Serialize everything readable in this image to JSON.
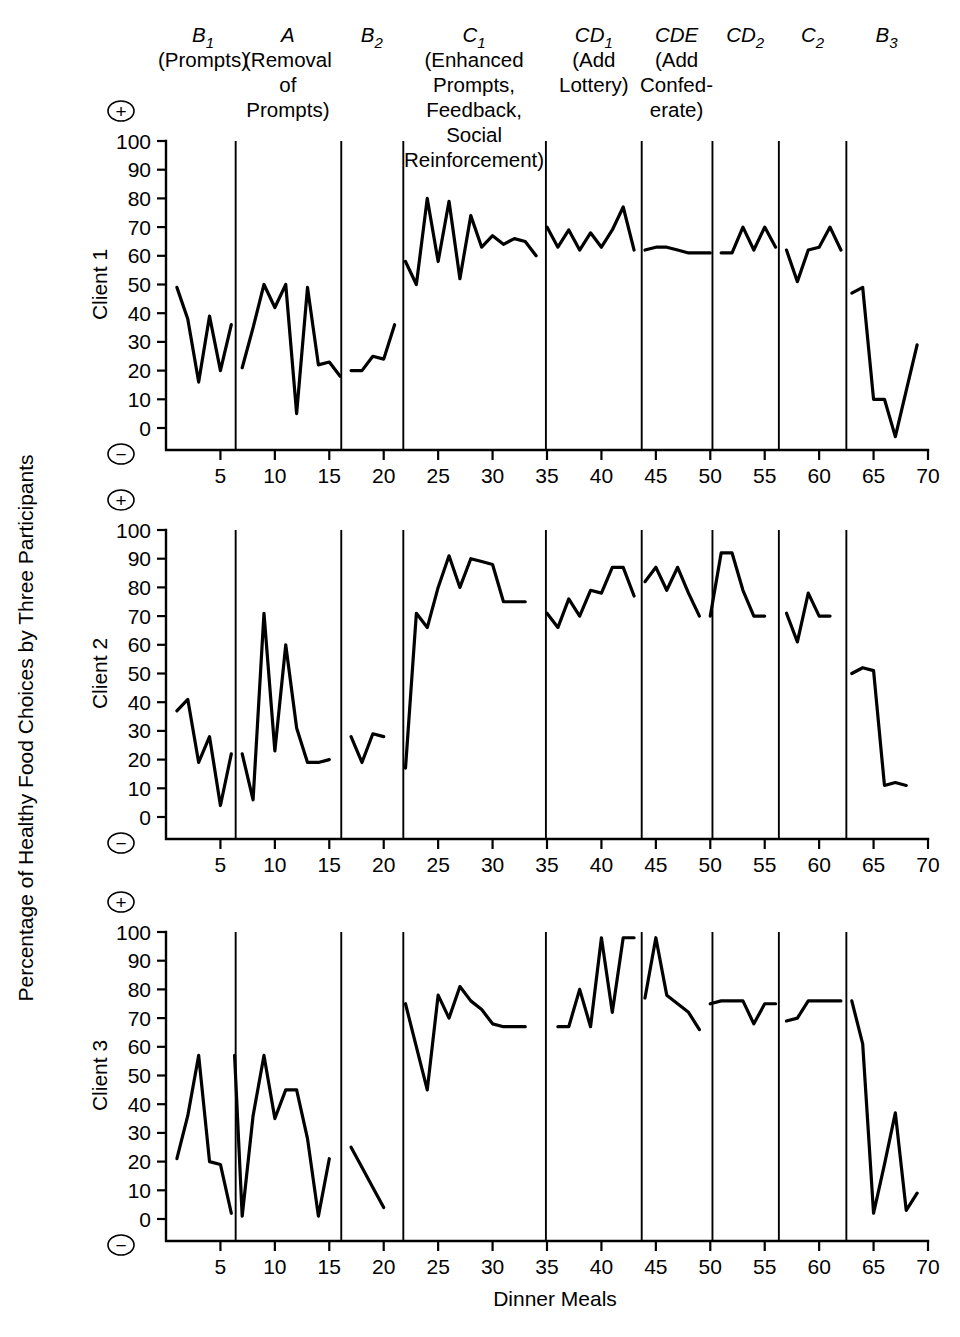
{
  "figure": {
    "ylabel": "Percentage of Healthy Food Choices by Three Participants",
    "xlabel": "Dinner Meals",
    "plus_sign": "+",
    "minus_sign": "−",
    "line_color": "#000000",
    "background": "#ffffff"
  },
  "axes": {
    "y_ticks": [
      100,
      90,
      80,
      70,
      60,
      50,
      40,
      30,
      20,
      10,
      0
    ],
    "y_tick_labels": [
      "100",
      "90",
      "80",
      "70",
      "60",
      "50",
      "40",
      "30",
      "20",
      "10",
      "0"
    ],
    "x_ticks": [
      5,
      10,
      15,
      20,
      25,
      30,
      35,
      40,
      45,
      50,
      55,
      60,
      65,
      70
    ],
    "x_tick_labels": [
      "5",
      "10",
      "15",
      "20",
      "25",
      "30",
      "35",
      "40",
      "45",
      "50",
      "55",
      "60",
      "65",
      "70"
    ],
    "xlim": [
      0,
      70
    ],
    "ylim": [
      0,
      100
    ],
    "grid": false
  },
  "phases": [
    {
      "id": "B1",
      "code": "B",
      "sub": "1",
      "desc_lines": [
        "(Prompts)"
      ],
      "start": 0.6,
      "end": 6.4,
      "center": 3.4
    },
    {
      "id": "A",
      "code": "A",
      "sub": "",
      "desc_lines": [
        "(Removal",
        "of",
        "Prompts)"
      ],
      "start": 6.4,
      "end": 16.1,
      "center": 11.2
    },
    {
      "id": "B2",
      "code": "B",
      "sub": "2",
      "desc_lines": [],
      "start": 16.1,
      "end": 21.8,
      "center": 18.9
    },
    {
      "id": "C1",
      "code": "C",
      "sub": "1",
      "desc_lines": [
        "(Enhanced",
        "Prompts,",
        "Feedback,",
        "Social",
        "Reinforcement)"
      ],
      "start": 21.8,
      "end": 34.9,
      "center": 28.3
    },
    {
      "id": "CD1",
      "code": "CD",
      "sub": "1",
      "desc_lines": [
        "(Add",
        "Lottery)"
      ],
      "start": 34.9,
      "end": 43.7,
      "center": 39.3
    },
    {
      "id": "CDE",
      "code": "CDE",
      "sub": "",
      "desc_lines": [
        "(Add",
        "Confed-",
        "erate)"
      ],
      "start": 43.7,
      "end": 50.2,
      "center": 46.9
    },
    {
      "id": "CD2",
      "code": "CD",
      "sub": "2",
      "desc_lines": [],
      "start": 50.2,
      "end": 56.3,
      "center": 53.2
    },
    {
      "id": "C2",
      "code": "C",
      "sub": "2",
      "desc_lines": [],
      "start": 56.3,
      "end": 62.5,
      "center": 59.4
    },
    {
      "id": "B3",
      "code": "B",
      "sub": "3",
      "desc_lines": [],
      "start": 62.5,
      "end": 70.0,
      "center": 66.2
    }
  ],
  "chart_data": {
    "type": "line",
    "title": "",
    "xlabel": "Dinner Meals",
    "ylabel": "Percentage of Healthy Food Choices by Three Participants",
    "xlim": [
      0,
      70
    ],
    "ylim": [
      0,
      100
    ],
    "grid": false,
    "legend": "none",
    "panels": [
      {
        "name": "Client 1",
        "label": "Client 1",
        "series": [
          {
            "phase": "B1",
            "x": [
              1,
              2,
              3,
              4,
              5,
              6
            ],
            "y": [
              49,
              38,
              16,
              39,
              20,
              36
            ]
          },
          {
            "phase": "A",
            "x": [
              7,
              8,
              9,
              10,
              11,
              12,
              13,
              14,
              15,
              16
            ],
            "y": [
              21,
              35,
              50,
              42,
              50,
              5,
              49,
              22,
              23,
              18
            ]
          },
          {
            "phase": "B2",
            "x": [
              17,
              18,
              19,
              20,
              21
            ],
            "y": [
              20,
              20,
              25,
              24,
              36
            ]
          },
          {
            "phase": "C1",
            "x": [
              22,
              23,
              24,
              25,
              26,
              27,
              28,
              29,
              30,
              31,
              32,
              33,
              34
            ],
            "y": [
              58,
              50,
              80,
              58,
              79,
              52,
              74,
              63,
              67,
              64,
              66,
              65,
              60
            ]
          },
          {
            "phase": "CD1",
            "x": [
              35,
              36,
              37,
              38,
              39,
              40,
              41,
              42,
              43
            ],
            "y": [
              70,
              63,
              69,
              62,
              68,
              63,
              69,
              77,
              62
            ]
          },
          {
            "phase": "CDE",
            "x": [
              44,
              45,
              46,
              47,
              48,
              49,
              50
            ],
            "y": [
              62,
              63,
              63,
              62,
              61,
              61,
              61
            ]
          },
          {
            "phase": "CD2",
            "x": [
              51,
              52,
              53,
              54,
              55,
              56
            ],
            "y": [
              61,
              61,
              70,
              62,
              70,
              63
            ]
          },
          {
            "phase": "C2",
            "x": [
              57,
              58,
              59,
              60,
              61,
              62
            ],
            "y": [
              62,
              51,
              62,
              63,
              70,
              62
            ]
          },
          {
            "phase": "B3",
            "x": [
              63,
              64,
              65,
              66,
              67,
              68,
              69
            ],
            "y": [
              47,
              49,
              10,
              10,
              -3,
              13,
              29
            ]
          }
        ]
      },
      {
        "name": "Client 2",
        "label": "Client 2",
        "series": [
          {
            "phase": "B1",
            "x": [
              1,
              2,
              3,
              4,
              5,
              6
            ],
            "y": [
              37,
              41,
              19,
              28,
              4,
              22
            ]
          },
          {
            "phase": "A",
            "x": [
              7,
              8,
              9,
              10,
              11,
              12,
              13,
              14,
              15
            ],
            "y": [
              22,
              6,
              71,
              23,
              60,
              31,
              19,
              19,
              20
            ]
          },
          {
            "phase": "B2",
            "x": [
              17,
              18,
              19,
              20
            ],
            "y": [
              28,
              19,
              29,
              28
            ]
          },
          {
            "phase": "C1",
            "x": [
              22,
              23,
              24,
              25,
              26,
              27,
              28,
              29,
              30,
              31,
              32,
              33
            ],
            "y": [
              17,
              71,
              66,
              80,
              91,
              80,
              90,
              89,
              88,
              75,
              75,
              75
            ]
          },
          {
            "phase": "CD1",
            "x": [
              35,
              36,
              37,
              38,
              39,
              40,
              41,
              42,
              43
            ],
            "y": [
              71,
              66,
              76,
              70,
              79,
              78,
              87,
              87,
              77
            ]
          },
          {
            "phase": "CDE",
            "x": [
              44,
              45,
              46,
              47,
              48,
              49
            ],
            "y": [
              82,
              87,
              79,
              87,
              78,
              70
            ]
          },
          {
            "phase": "CD2",
            "x": [
              50,
              51,
              52,
              53,
              54,
              55
            ],
            "y": [
              70,
              92,
              92,
              79,
              70,
              70
            ]
          },
          {
            "phase": "C2",
            "x": [
              57,
              58,
              59,
              60,
              61
            ],
            "y": [
              71,
              61,
              78,
              70,
              70
            ]
          },
          {
            "phase": "B3",
            "x": [
              63,
              64,
              65,
              66,
              67,
              68
            ],
            "y": [
              50,
              52,
              51,
              11,
              12,
              11
            ]
          }
        ]
      },
      {
        "name": "Client 3",
        "label": "Client 3",
        "series": [
          {
            "phase": "B1",
            "x": [
              1,
              2,
              3,
              4,
              5,
              6
            ],
            "y": [
              21,
              36,
              57,
              20,
              19,
              2
            ]
          },
          {
            "phase": "A",
            "x": [
              6.3,
              7,
              8,
              9,
              10,
              11,
              12,
              13,
              14,
              15
            ],
            "y": [
              57,
              1,
              36,
              57,
              35,
              45,
              45,
              28,
              1,
              21
            ]
          },
          {
            "phase": "B2",
            "x": [
              17,
              18,
              19,
              20
            ],
            "y": [
              25,
              18,
              11,
              4
            ]
          },
          {
            "phase": "C1",
            "x": [
              22,
              23,
              24,
              25,
              26,
              27,
              28,
              29,
              30,
              31,
              32,
              33
            ],
            "y": [
              75,
              60,
              45,
              78,
              70,
              81,
              76,
              73,
              68,
              67,
              67,
              67
            ]
          },
          {
            "phase": "CD1",
            "x": [
              36,
              37,
              38,
              39,
              40,
              41,
              42,
              43
            ],
            "y": [
              67,
              67,
              80,
              67,
              98,
              72,
              98,
              98
            ]
          },
          {
            "phase": "CDE",
            "x": [
              44,
              45,
              46,
              47,
              48,
              49
            ],
            "y": [
              77,
              98,
              78,
              75,
              72,
              66
            ]
          },
          {
            "phase": "CD2",
            "x": [
              50,
              51,
              52,
              53,
              54,
              55,
              56
            ],
            "y": [
              75,
              76,
              76,
              76,
              68,
              75,
              75
            ]
          },
          {
            "phase": "C2",
            "x": [
              57,
              58,
              59,
              60,
              61,
              62
            ],
            "y": [
              69,
              70,
              76,
              76,
              76,
              76
            ]
          },
          {
            "phase": "B3",
            "x": [
              63,
              64,
              65,
              66,
              67,
              68,
              69
            ],
            "y": [
              76,
              61,
              2,
              19,
              37,
              3,
              9
            ]
          }
        ]
      }
    ]
  }
}
